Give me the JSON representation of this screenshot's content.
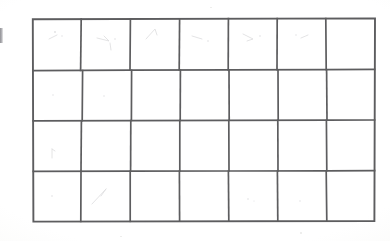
{
  "document": {
    "type": "scanned-paper",
    "title": "Hand-drawn blank grid",
    "background_color": "#fdfdfc",
    "ink_color": "#5d5d5f",
    "content_text": ""
  },
  "grid": {
    "columns": 7,
    "rows": 4,
    "total_cells": 28,
    "cells_filled": 0,
    "cell_text": "",
    "bounds": {
      "left": 32,
      "top": 18,
      "width": 343,
      "height": 204
    },
    "column_x": [
      0,
      49,
      98,
      147,
      196,
      245,
      294,
      343
    ],
    "row_y": [
      0,
      52,
      102,
      153,
      204
    ],
    "rows_data": [
      {
        "index": 1,
        "cells": [
          "",
          "",
          "",
          "",
          "",
          "",
          ""
        ]
      },
      {
        "index": 2,
        "cells": [
          "",
          "",
          "",
          "",
          "",
          "",
          ""
        ]
      },
      {
        "index": 3,
        "cells": [
          "",
          "",
          "",
          "",
          "",
          "",
          ""
        ]
      },
      {
        "index": 4,
        "cells": [
          "",
          "",
          "",
          "",
          "",
          "",
          ""
        ]
      }
    ]
  },
  "artifacts": {
    "edge_mark_label": "left-page-edge-mark",
    "smudge_label": "pencil-smudge"
  }
}
